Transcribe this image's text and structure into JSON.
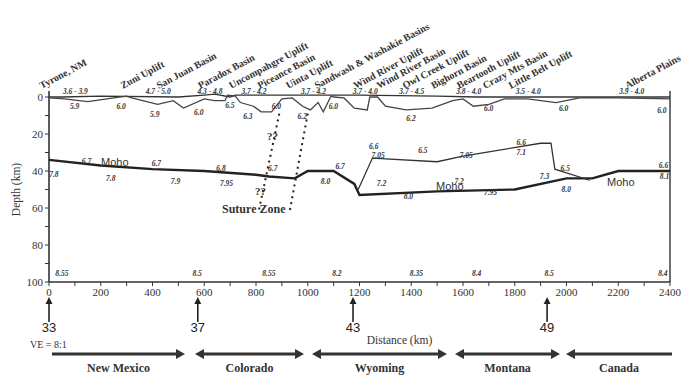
{
  "chart_data": {
    "type": "cross-section",
    "title": "",
    "xlabel": "Distance (km)",
    "ylabel": "Depth (km)",
    "xlim": [
      0,
      2400
    ],
    "ylim": [
      100,
      0
    ],
    "x_ticks": [
      "0",
      "200",
      "400",
      "600",
      "800",
      "1000",
      "1200",
      "1400",
      "1600",
      "1800",
      "2000",
      "2200",
      "2400"
    ],
    "y_ticks": [
      "0",
      "20",
      "40",
      "60",
      "80",
      "100"
    ],
    "vertical_exaggeration": "VE = 8:1",
    "geologic_features": [
      {
        "label": "Tyrone, NM",
        "x": 30
      },
      {
        "label": "Zuni Uplift",
        "x": 300
      },
      {
        "label": "San Juan Basin",
        "x": 440
      },
      {
        "label": "Paradox Basin",
        "x": 600
      },
      {
        "label": "Uncompahgre Uplift",
        "x": 720
      },
      {
        "label": "Piceance Basin",
        "x": 830
      },
      {
        "label": "Uinta Uplift",
        "x": 940
      },
      {
        "label": "Sandwash & Washakie Basins",
        "x": 1050
      },
      {
        "label": "Wind River Uplift",
        "x": 1200
      },
      {
        "label": "Wind River Basin",
        "x": 1290
      },
      {
        "label": "Owl Creek Uplift",
        "x": 1390
      },
      {
        "label": "Bighorn Basin",
        "x": 1500
      },
      {
        "label": "Beartooth Uplift",
        "x": 1600
      },
      {
        "label": "Crazy Mts Basin",
        "x": 1700
      },
      {
        "label": "Little Belt Uplift",
        "x": 1800
      },
      {
        "label": "Alberta Plains",
        "x": 2250
      }
    ],
    "sediment_velocities": [
      {
        "label": "3.6 - 3.9",
        "x": 100
      },
      {
        "label": "4.7 - 5.0",
        "x": 420
      },
      {
        "label": "4.3 - 4.8",
        "x": 620
      },
      {
        "label": "3.7 - 4.2",
        "x": 790
      },
      {
        "label": "3.7 - 4.2",
        "x": 1020
      },
      {
        "label": "3.7 - 4.0",
        "x": 1220
      },
      {
        "label": "3.7 - 4.5",
        "x": 1400
      },
      {
        "label": "3.8 - 4.0",
        "x": 1620
      },
      {
        "label": "3.5 - 4.0",
        "x": 1850
      },
      {
        "label": "3.9 - 4.0",
        "x": 2250
      }
    ],
    "upper_crust_velocities": [
      {
        "label": "5.9",
        "x": 100
      },
      {
        "label": "6.0",
        "x": 280
      },
      {
        "label": "5.9",
        "x": 410
      },
      {
        "label": "6.0",
        "x": 580
      },
      {
        "label": "6.5",
        "x": 700
      },
      {
        "label": "6.3",
        "x": 770
      },
      {
        "label": "6.0",
        "x": 880
      },
      {
        "label": "6.2",
        "x": 980
      },
      {
        "label": "6.0",
        "x": 1100
      },
      {
        "label": "6.2",
        "x": 1400
      },
      {
        "label": "6.0",
        "x": 1700
      },
      {
        "label": "6.0",
        "x": 1990
      },
      {
        "label": "6.0",
        "x": 2370
      }
    ],
    "lower_crust_velocities": [
      {
        "label": "6.7",
        "x": 150
      },
      {
        "label": "6.7",
        "x": 420
      },
      {
        "label": "6.8",
        "x": 670
      },
      {
        "label": "6.7",
        "x": 870
      },
      {
        "label": "6.7",
        "x": 1130
      },
      {
        "label": "6.6",
        "x": 1260
      },
      {
        "label": "7.05",
        "x": 1270
      },
      {
        "label": "6.5",
        "x": 1450
      },
      {
        "label": "7.05",
        "x": 1610
      },
      {
        "label": "6.6",
        "x": 1830
      },
      {
        "label": "7.1",
        "x": 1830
      },
      {
        "label": "6.5",
        "x": 2000
      },
      {
        "label": "6.6",
        "x": 2380
      },
      {
        "label": "7.2",
        "x": 1290
      },
      {
        "label": "7.2",
        "x": 1590
      },
      {
        "label": "7.3",
        "x": 1920
      }
    ],
    "upper_mantle_velocities": [
      {
        "label": "7.8",
        "x": 20
      },
      {
        "label": "7.8",
        "x": 240
      },
      {
        "label": "7.9",
        "x": 490
      },
      {
        "label": "7.95",
        "x": 680
      },
      {
        "label": "8.0",
        "x": 1070
      },
      {
        "label": "8.0",
        "x": 1390
      },
      {
        "label": "7.95",
        "x": 1700
      },
      {
        "label": "8.0",
        "x": 2000
      },
      {
        "label": "8.1",
        "x": 2380
      }
    ],
    "deep_velocities": [
      {
        "label": "8.55",
        "x": 40
      },
      {
        "label": "8.5",
        "x": 570
      },
      {
        "label": "8.55",
        "x": 840
      },
      {
        "label": "8.2",
        "x": 1110
      },
      {
        "label": "8.35",
        "x": 1410
      },
      {
        "label": "8.4",
        "x": 1650
      },
      {
        "label": "8.5",
        "x": 1930
      },
      {
        "label": "8.4",
        "x": 2370
      }
    ],
    "moho_depth_profile": [
      {
        "x": 0,
        "depth": 34
      },
      {
        "x": 200,
        "depth": 37
      },
      {
        "x": 400,
        "depth": 39
      },
      {
        "x": 600,
        "depth": 40
      },
      {
        "x": 800,
        "depth": 42
      },
      {
        "x": 850,
        "depth": 43
      },
      {
        "x": 950,
        "depth": 44
      },
      {
        "x": 1000,
        "depth": 40
      },
      {
        "x": 1100,
        "depth": 40
      },
      {
        "x": 1180,
        "depth": 47
      },
      {
        "x": 1200,
        "depth": 53
      },
      {
        "x": 1500,
        "depth": 51
      },
      {
        "x": 1800,
        "depth": 50
      },
      {
        "x": 2000,
        "depth": 44
      },
      {
        "x": 2100,
        "depth": 44
      },
      {
        "x": 2200,
        "depth": 40
      },
      {
        "x": 2400,
        "depth": 40
      }
    ],
    "annotations": [
      "Moho",
      "Moho",
      "Moho",
      "??",
      "??",
      "Suture Zone"
    ],
    "latitude_markers": [
      {
        "label": "33",
        "x": 0
      },
      {
        "label": "37",
        "x": 575
      },
      {
        "label": "43",
        "x": 1175
      },
      {
        "label": "49",
        "x": 1925
      }
    ],
    "states": [
      "New Mexico",
      "Colorado",
      "Wyoming",
      "Montana",
      "Canada"
    ]
  },
  "labels": {
    "moho": "Moho",
    "qq": "??",
    "suture": "Suture Zone",
    "ve": "VE = 8:1",
    "xlabel": "Distance (km)",
    "ylabel": "Depth (km)"
  }
}
